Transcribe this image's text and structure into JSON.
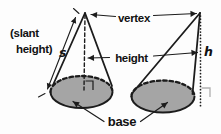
{
  "diagram": {
    "labels": {
      "slant_height_line1": "(slant",
      "slant_height_line2": "height)",
      "slant_symbol": "s",
      "vertex": "vertex",
      "height": "height",
      "height_symbol": "h",
      "base": "base"
    },
    "colors": {
      "line": "#1c1c1c",
      "text": "#111111",
      "base_fill": "#a5a5a5",
      "light_marker": "#b0b0b0",
      "background": "#fdfdfd"
    }
  }
}
